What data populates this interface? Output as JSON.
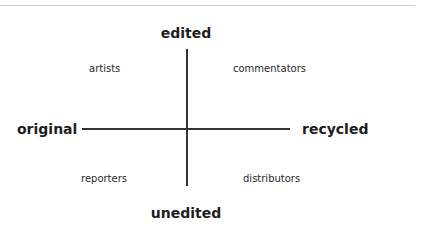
{
  "diagram": {
    "type": "quadrant",
    "axes": {
      "vertical": {
        "top": "edited",
        "bottom": "unedited"
      },
      "horizontal": {
        "left": "original",
        "right": "recycled"
      }
    },
    "quadrants": {
      "top_left": "artists",
      "top_right": "commentators",
      "bottom_left": "reporters",
      "bottom_right": "distributors"
    },
    "colors": {
      "axis_line": "#333333",
      "text": "#222222",
      "top_rule": "#cfcfcf",
      "background": "#ffffff"
    }
  }
}
